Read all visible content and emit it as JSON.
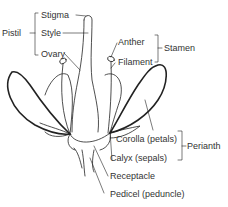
{
  "diagram": {
    "labels": {
      "stigma": "Stigma",
      "style": "Style",
      "ovary": "Ovary",
      "pistil": "Pistil",
      "anther": "Anther",
      "filament": "Filament",
      "stamen": "Stamen",
      "corolla": "Corolla (petals)",
      "calyx": "Calyx (sepals)",
      "perianth": "Perianth",
      "receptacle": "Receptacle",
      "pedicel": "Pedicel (peduncle)"
    },
    "colors": {
      "line": "#222222",
      "text": "#333333",
      "background": "#ffffff"
    }
  }
}
